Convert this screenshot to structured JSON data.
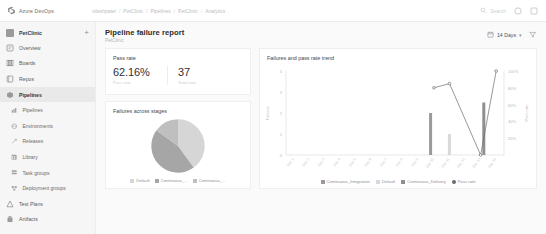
{
  "topbar": {
    "brand": "Azure DevOps",
    "brand_icon": "azure-devops-logo-icon",
    "breadcrumbs": [
      "nileshpatel",
      "PetClinic",
      "Pipelines",
      "PetClinic",
      "Analytics"
    ],
    "search_placeholder": "Search",
    "search_icon": "search-icon",
    "help_icon": "help-icon",
    "user_icon": "user-avatar-icon"
  },
  "sidebar": {
    "project": {
      "name": "PetClinic",
      "icon": "project-icon",
      "add_label": "+"
    },
    "items": [
      {
        "label": "Overview",
        "icon": "overview-icon",
        "active": false,
        "sub": false
      },
      {
        "label": "Boards",
        "icon": "boards-icon",
        "active": false,
        "sub": false
      },
      {
        "label": "Repos",
        "icon": "repos-icon",
        "active": false,
        "sub": false
      },
      {
        "label": "Pipelines",
        "icon": "pipelines-icon",
        "active": true,
        "sub": false
      },
      {
        "label": "Pipelines",
        "icon": "pipelines-sub-icon",
        "active": false,
        "sub": true
      },
      {
        "label": "Environments",
        "icon": "environments-icon",
        "active": false,
        "sub": true
      },
      {
        "label": "Releases",
        "icon": "releases-icon",
        "active": false,
        "sub": true
      },
      {
        "label": "Library",
        "icon": "library-icon",
        "active": false,
        "sub": true
      },
      {
        "label": "Task groups",
        "icon": "task-groups-icon",
        "active": false,
        "sub": true
      },
      {
        "label": "Deployment groups",
        "icon": "deployment-groups-icon",
        "active": false,
        "sub": true
      },
      {
        "label": "Test Plans",
        "icon": "test-plans-icon",
        "active": false,
        "sub": false
      },
      {
        "label": "Artifacts",
        "icon": "artifacts-icon",
        "active": false,
        "sub": false
      }
    ]
  },
  "page": {
    "title": "Pipeline failure report",
    "subtitle": "PetClinic",
    "date_range": "14 Days",
    "calendar_icon": "calendar-icon",
    "chevron_icon": "chevron-down-icon",
    "filter_icon": "filter-icon"
  },
  "pass_rate_card": {
    "title": "Pass rate",
    "metrics": [
      {
        "value": "62.16%",
        "caption": "Pass rate"
      },
      {
        "value": "37",
        "caption": "Total runs"
      }
    ]
  },
  "colors": {
    "pie_default": "#d6d6d6",
    "pie_ci": "#a6a6a6",
    "pie_cd": "#bfbfbf",
    "bar_ci": "#9a9a9a",
    "bar_default": "#d9d9d9",
    "bar_cd": "#8f8f8f",
    "line_pass_rate": "#6b6b6b",
    "axis": "#d9d9d9",
    "text_muted": "#8d9096"
  },
  "chart_data": [
    {
      "type": "pie",
      "title": "Failures across stages",
      "categories": [
        "Default",
        "Continuous_...",
        "Continuous_..."
      ],
      "values": [
        40,
        45,
        15
      ],
      "legend_position": "bottom"
    },
    {
      "type": "bar",
      "title": "Failures and pass rate trend",
      "xlabel": "",
      "ylabel": "Failures",
      "y2label": "Pass rate",
      "ylim": [
        0,
        4
      ],
      "yticks": [
        "0",
        "1",
        "2",
        "3",
        "4"
      ],
      "y2lim": [
        0,
        100
      ],
      "y2ticks": [
        "20%",
        "40%",
        "60%",
        "80%",
        "100%"
      ],
      "grid": false,
      "legend_position": "bottom",
      "categories": [
        "Day 1",
        "Day 2",
        "Day 3",
        "Day 4",
        "Day 5",
        "Day 6",
        "Day 7",
        "Day 8",
        "Day 9",
        "Day 10",
        "Day 11",
        "Day 12",
        "Day 13",
        "Day 14"
      ],
      "series": [
        {
          "name": "Continuous_Integration",
          "type": "bar",
          "values": [
            0,
            0,
            0,
            0,
            0,
            0,
            0,
            0,
            0,
            2,
            0,
            0,
            0,
            0
          ]
        },
        {
          "name": "Default",
          "type": "bar",
          "values": [
            0,
            0,
            0,
            0,
            0,
            0,
            0,
            0,
            0,
            0,
            1,
            0,
            0,
            0
          ]
        },
        {
          "name": "Continuous_Delivery",
          "type": "bar",
          "values": [
            0,
            0,
            0,
            0,
            0,
            0,
            0,
            0,
            0,
            0,
            0,
            0,
            2.5,
            0
          ]
        },
        {
          "name": "Pass rate",
          "type": "line",
          "values": [
            null,
            null,
            null,
            null,
            null,
            null,
            null,
            null,
            null,
            80,
            85,
            null,
            0,
            100
          ]
        }
      ]
    }
  ]
}
